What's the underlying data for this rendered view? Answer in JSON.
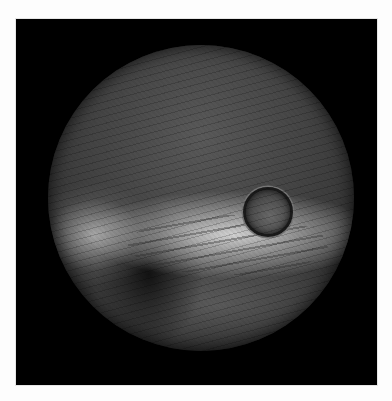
{
  "image": {
    "description": "Circular wide-angle photograph of a dark textured dome interior with a small circular porthole near the center and a bright reflective band across the lower half",
    "background_color": "#000000",
    "page_background": "#fdfdfd"
  }
}
